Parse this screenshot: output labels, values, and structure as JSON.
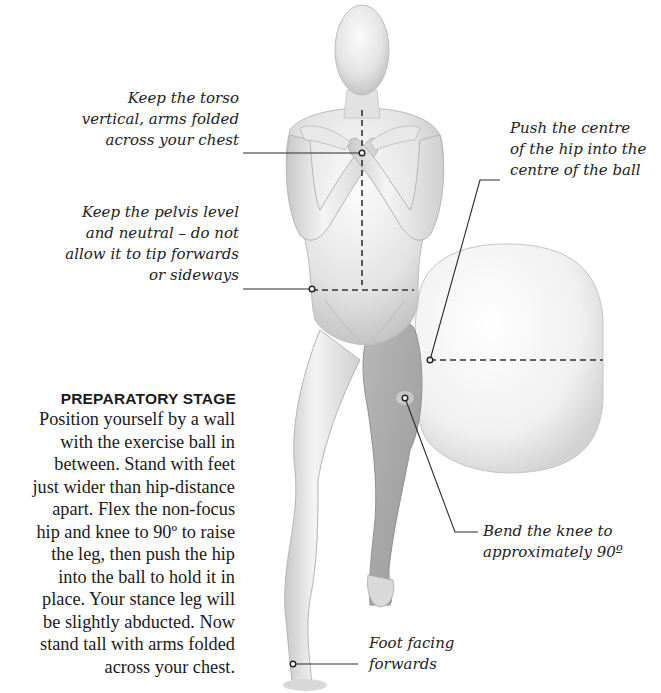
{
  "annotations": {
    "torso": {
      "lines": [
        "Keep the torso",
        "vertical, arms folded",
        "across your chest"
      ]
    },
    "pelvis": {
      "lines": [
        "Keep the pelvis level",
        "and neutral – do not",
        "allow it to tip forwards",
        "or sideways"
      ]
    },
    "hip": {
      "lines": [
        "Push the centre",
        "of the hip into the",
        "centre of the ball"
      ]
    },
    "knee": {
      "lines": [
        "Bend the knee to",
        "approximately 90º"
      ]
    },
    "foot": {
      "lines": [
        "Foot facing",
        "forwards"
      ]
    }
  },
  "preparatory_stage": {
    "title": "PREPARATORY STAGE",
    "lines": [
      "Position yourself by a wall",
      "with the exercise ball in",
      "between. Stand with feet",
      "just wider than hip-distance",
      "apart. Flex the non-focus",
      "hip and knee to 90º to raise",
      "the leg, then push the hip",
      "into the ball to hold it in",
      "place. Your stance leg will",
      "be slightly abducted. Now",
      "stand tall with arms folded",
      "across your chest."
    ]
  },
  "colors": {
    "figure_skin": "#e6e6e6",
    "figure_shadow": "#bdbdbd",
    "focus_leg": "#a8a8a8",
    "ball": "#f2f2f2",
    "leader_line": "#2a2a2a"
  }
}
